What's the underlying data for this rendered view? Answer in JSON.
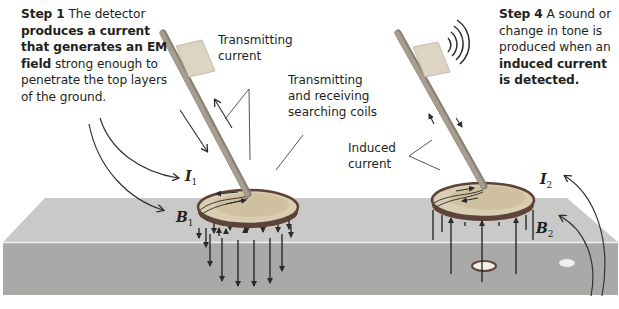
{
  "step1": {
    "heading": "Step 1",
    "text_a": " The detector ",
    "bold": "produces a current that generates an EM field",
    "text_b": " strong enough to penetrate the top layers of the ground."
  },
  "step4": {
    "heading": "Step 4",
    "text_a": " A sound or change in tone is produced when an ",
    "bold": "induced current is detected."
  },
  "labels": {
    "transmitting_current": [
      "Transmitting",
      "current"
    ],
    "coils": [
      "Transmitting",
      "and receiving",
      "searching coils"
    ],
    "induced_current": [
      "Induced",
      "current"
    ]
  },
  "symbols": {
    "I1": {
      "letter": "I",
      "sub": "1"
    },
    "B1": {
      "letter": "B",
      "sub": "1"
    },
    "I2": {
      "letter": "I",
      "sub": "2"
    },
    "B2": {
      "letter": "B",
      "sub": "2"
    }
  },
  "colors": {
    "ground_top": "#c9c9c7",
    "ground_front": "#a9a9a7",
    "disc": "#d9cdb2",
    "disc_inner": "#cfc1a0",
    "rim": "#5e4438",
    "handle": "#a79d90",
    "box": "#ddd4c4",
    "lines": "#2b2b2b"
  }
}
